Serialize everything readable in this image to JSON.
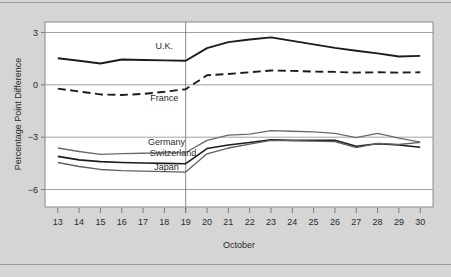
{
  "chart_data": {
    "type": "line",
    "title": "",
    "subtitle": "",
    "xlabel": "October",
    "ylabel": "Percentage Point Difference",
    "xlim": [
      12.4,
      30.6
    ],
    "ylim": [
      -7.0,
      3.6
    ],
    "yticks": [
      3,
      0,
      -3,
      -6
    ],
    "ytick_labels": [
      "3",
      "0",
      "−3",
      "−6"
    ],
    "x": [
      13,
      14,
      15,
      16,
      17,
      18,
      19,
      20,
      21,
      22,
      23,
      24,
      25,
      26,
      27,
      28,
      29,
      30
    ],
    "xtick_labels": [
      "13",
      "14",
      "15",
      "16",
      "17",
      "18",
      "19",
      "20",
      "21",
      "22",
      "23",
      "24",
      "25",
      "26",
      "27",
      "28",
      "29",
      "30"
    ],
    "grid": "horizontal-at-yticks",
    "legend_position": "inline-annotations",
    "annotations": [
      {
        "text": "U.K.",
        "x": 18.0,
        "y": 2.05
      },
      {
        "text": "France",
        "x": 18.0,
        "y": -0.95
      },
      {
        "text": "Germany",
        "x": 18.1,
        "y": -3.45
      },
      {
        "text": "Switzerland",
        "x": 18.4,
        "y": -4.05
      },
      {
        "text": "Japan",
        "x": 18.1,
        "y": -4.9
      }
    ],
    "reference_line": {
      "x": 19,
      "orientation": "vertical"
    },
    "series": [
      {
        "name": "U.K.",
        "style": "solid",
        "color": "#1c1c1c",
        "width": 1.9,
        "values": [
          1.52,
          1.38,
          1.22,
          1.45,
          1.42,
          1.4,
          1.38,
          2.1,
          2.45,
          2.6,
          2.72,
          2.52,
          2.32,
          2.12,
          1.95,
          1.8,
          1.62,
          1.66
        ]
      },
      {
        "name": "France",
        "style": "dashed",
        "color": "#1c1c1c",
        "width": 1.9,
        "values": [
          -0.22,
          -0.38,
          -0.55,
          -0.58,
          -0.52,
          -0.4,
          -0.25,
          0.55,
          0.62,
          0.72,
          0.82,
          0.8,
          0.76,
          0.74,
          0.7,
          0.72,
          0.7,
          0.72
        ]
      },
      {
        "name": "Germany",
        "style": "solid",
        "color": "#6a6a6a",
        "width": 1.3,
        "values": [
          -3.62,
          -3.82,
          -3.98,
          -3.94,
          -3.92,
          -3.9,
          -3.88,
          -3.18,
          -2.88,
          -2.82,
          -2.62,
          -2.66,
          -2.7,
          -2.78,
          -3.02,
          -2.78,
          -3.05,
          -3.28
        ]
      },
      {
        "name": "Switzerland",
        "style": "solid",
        "color": "#1c1c1c",
        "width": 1.6,
        "values": [
          -4.1,
          -4.3,
          -4.4,
          -4.45,
          -4.48,
          -4.5,
          -4.52,
          -3.65,
          -3.45,
          -3.3,
          -3.15,
          -3.18,
          -3.18,
          -3.18,
          -3.52,
          -3.38,
          -3.45,
          -3.58
        ]
      },
      {
        "name": "Japan",
        "style": "solid",
        "color": "#5f5f5f",
        "width": 1.3,
        "values": [
          -4.45,
          -4.68,
          -4.85,
          -4.92,
          -4.95,
          -4.97,
          -5.0,
          -3.95,
          -3.62,
          -3.4,
          -3.18,
          -3.2,
          -3.22,
          -3.25,
          -3.6,
          -3.35,
          -3.42,
          -3.3
        ]
      }
    ]
  },
  "figure": {
    "background_color": "#d5d5d5",
    "plot_background_color": "#ffffff"
  }
}
